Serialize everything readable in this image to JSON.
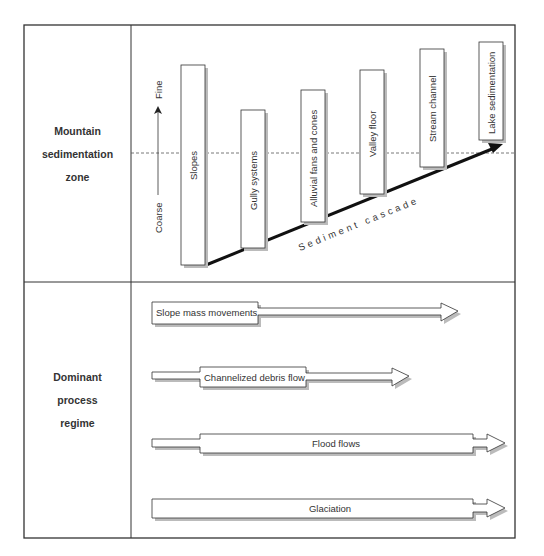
{
  "diagram": {
    "type": "sediment cascade diagram",
    "rows": [
      {
        "label_lines": [
          "Mountain",
          "sedimentation",
          "zone"
        ]
      },
      {
        "label_lines": [
          "Dominant",
          "process",
          "regime"
        ]
      }
    ],
    "grain_axis": {
      "low": "Coarse",
      "high": "Fine"
    },
    "stages": [
      {
        "label": "Slopes"
      },
      {
        "label": "Gully systems"
      },
      {
        "label": "Alluvial fans and cones"
      },
      {
        "label": "Valley floor"
      },
      {
        "label": "Stream channel"
      },
      {
        "label": "Lake sedimentation"
      }
    ],
    "cascade_label": "Sediment cascade",
    "processes": [
      {
        "label": "Slope mass movements"
      },
      {
        "label": "Channelized debris flow"
      },
      {
        "label": "Flood flows"
      },
      {
        "label": "Glaciation"
      }
    ],
    "colors": {
      "line": "#333333",
      "box_fill": "#ffffff",
      "shadow": "#bbbbbb",
      "text": "#333333"
    }
  }
}
